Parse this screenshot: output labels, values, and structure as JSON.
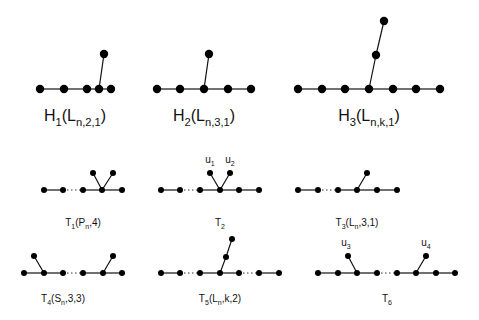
{
  "figure": {
    "graphs": [
      {
        "id": "H1",
        "label": "H",
        "label_sub": "1",
        "arg": "L",
        "arg_sub": "n,2,1",
        "path_nodes": 5,
        "attach_index": 3,
        "pendant_path_len": 1,
        "gaps": []
      },
      {
        "id": "H2",
        "label": "H",
        "label_sub": "2",
        "arg": "L",
        "arg_sub": "n,3,1",
        "path_nodes": 5,
        "attach_index": 2,
        "pendant_path_len": 1,
        "gaps": []
      },
      {
        "id": "H3",
        "label": "H",
        "label_sub": "3",
        "arg": "L",
        "arg_sub": "n,k,1",
        "path_nodes": 7,
        "attach_index": 3,
        "pendant_path_len": 2,
        "gaps": []
      },
      {
        "id": "T1",
        "label": "T",
        "label_sub": "1",
        "arg_text": "(P",
        "arg_sub": "n",
        "arg_tail": ",4)",
        "path_nodes": 5,
        "gaps": [
          1
        ],
        "pendants": [
          {
            "at": 3,
            "count": 2
          }
        ]
      },
      {
        "id": "T2",
        "label": "T",
        "label_sub": "2",
        "path_nodes": 6,
        "gaps": [
          1
        ],
        "pendants": [
          {
            "at": 3,
            "count": 2,
            "vertex_labels": [
              {
                "name": "u",
                "sub": "1"
              },
              {
                "name": "u",
                "sub": "2"
              }
            ]
          }
        ]
      },
      {
        "id": "T3",
        "label": "T",
        "label_sub": "3",
        "arg_text": "(L",
        "arg_sub": "n",
        "arg_tail": ",3,1)",
        "path_nodes": 6,
        "gaps": [
          1
        ],
        "pendants": [
          {
            "at": 3,
            "count": 1
          }
        ]
      },
      {
        "id": "T4",
        "label": "T",
        "label_sub": "4",
        "arg_text": "(S",
        "arg_sub": "n",
        "arg_tail": ",3,3)",
        "path_nodes": 6,
        "gaps": [
          2
        ],
        "pendants": [
          {
            "at": 1,
            "count": 1
          },
          {
            "at": 4,
            "count": 1
          }
        ]
      },
      {
        "id": "T5",
        "label": "T",
        "label_sub": "5",
        "arg_text": "(L",
        "arg_sub": "n",
        "arg_tail": ",k,2)",
        "path_nodes": 7,
        "gaps": [
          1,
          4
        ],
        "pendants": [
          {
            "at": 3,
            "count": 1,
            "path_len": 2
          }
        ]
      },
      {
        "id": "T6",
        "label": "T",
        "label_sub": "6",
        "path_nodes": 8,
        "gaps": [
          3
        ],
        "pendants": [
          {
            "at": 2,
            "count": 1,
            "vertex_labels": [
              {
                "name": "u",
                "sub": "3"
              }
            ]
          },
          {
            "at": 5,
            "count": 1,
            "vertex_labels": [
              {
                "name": "u",
                "sub": "4"
              }
            ]
          }
        ]
      }
    ]
  }
}
